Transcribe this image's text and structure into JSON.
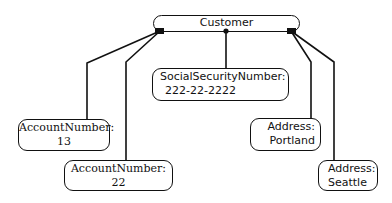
{
  "diagram": {
    "type": "object-graph",
    "root": {
      "label": "Customer"
    },
    "nodes": [
      {
        "id": "ssn",
        "label": "SocialSecurityNumber:",
        "value": "222-22-2222"
      },
      {
        "id": "acct13",
        "label": "AccountNumber:",
        "value": "13"
      },
      {
        "id": "acct22",
        "label": "AccountNumber:",
        "value": "22"
      },
      {
        "id": "addrPortland",
        "label": "Address:",
        "value": "Portland"
      },
      {
        "id": "addrSeattle",
        "label": "Address:",
        "value": "Seattle"
      }
    ],
    "edges": [
      {
        "from": "Customer",
        "to": "ssn",
        "connector": "dot"
      },
      {
        "from": "Customer",
        "to": "acct13",
        "connector": "square-left"
      },
      {
        "from": "Customer",
        "to": "acct22",
        "connector": "square-left"
      },
      {
        "from": "Customer",
        "to": "addrPortland",
        "connector": "square-right"
      },
      {
        "from": "Customer",
        "to": "addrSeattle",
        "connector": "square-right"
      }
    ],
    "colors": {
      "stroke": "#111111",
      "background": "#ffffff"
    }
  }
}
